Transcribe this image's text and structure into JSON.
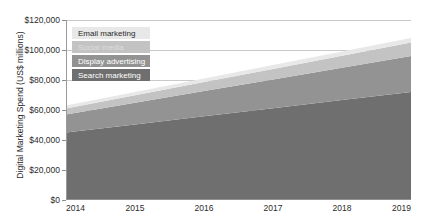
{
  "chart_data": {
    "type": "area",
    "stacked": true,
    "title": "",
    "subtitle": "",
    "xlabel": "",
    "ylabel": "Digital Marketing Spend (US$ millions)",
    "x": [
      2014,
      2015,
      2016,
      2017,
      2018,
      2019
    ],
    "xticklabels": [
      "2014",
      "2015",
      "2016",
      "2017",
      "2018",
      "2019"
    ],
    "yticklabels": [
      "$0",
      "$20,000",
      "$40,000",
      "$60,000",
      "$80,000",
      "$100,000",
      "$120,000"
    ],
    "ytickvalues": [
      0,
      20000,
      40000,
      60000,
      80000,
      100000,
      120000
    ],
    "ylim": [
      0,
      120000
    ],
    "xlim": [
      2014,
      2019
    ],
    "grid": "horizontal",
    "legend_position": "upper-left-inside",
    "series": [
      {
        "name": "Search marketing",
        "color": "#6f6f6f",
        "values": [
          45000,
          50400,
          55800,
          61200,
          66600,
          72000
        ]
      },
      {
        "name": "Display advertising",
        "color": "#939393",
        "values": [
          12000,
          14400,
          16800,
          19200,
          21600,
          24000
        ]
      },
      {
        "name": "Social media",
        "color": "#c3c3c3",
        "values": [
          4000,
          5000,
          6000,
          7000,
          8000,
          9000
        ]
      },
      {
        "name": "Email marketing",
        "color": "#e8e8e8",
        "values": [
          2000,
          2200,
          2400,
          2600,
          2800,
          3000
        ]
      }
    ],
    "cumulative_totals": [
      63000,
      72000,
      81000,
      90000,
      99000,
      108000
    ]
  },
  "legend": {
    "items": [
      {
        "label": "Email marketing",
        "swatch": "#e8e8e8",
        "text_color": "#2b2b2b"
      },
      {
        "label": "Social media",
        "swatch": "#c3c3c3",
        "text_color": "#dddddd"
      },
      {
        "label": "Display advertising",
        "swatch": "#939393",
        "text_color": "#ffffff"
      },
      {
        "label": "Search marketing",
        "swatch": "#6f6f6f",
        "text_color": "#ffffff"
      }
    ]
  },
  "axis": {
    "y_title": "Digital Marketing Spend (US$ millions)",
    "y_ticks": [
      "$120,000",
      "$100,000",
      "$80,000",
      "$60,000",
      "$40,000",
      "$20,000",
      "$0"
    ],
    "x_ticks": [
      "2014",
      "2015",
      "2016",
      "2017",
      "2018",
      "2019"
    ]
  },
  "colors": {
    "gridline": "#c9c9c9",
    "axis": "#8f8f8f",
    "text": "#2b2b2b",
    "background": "#ffffff"
  }
}
